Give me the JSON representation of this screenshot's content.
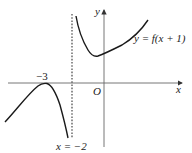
{
  "diagram": {
    "type": "function-graph",
    "curve_label": "y = f(x + 1)",
    "axes": {
      "x_label": "x",
      "y_label": "y",
      "origin_label": "O"
    },
    "annotations": {
      "turning_point_label": "−3",
      "asymptote_label": "x = −2"
    },
    "colors": {
      "curve": "#1a1a1a",
      "axis": "#555555",
      "asymptote": "#333333"
    }
  }
}
